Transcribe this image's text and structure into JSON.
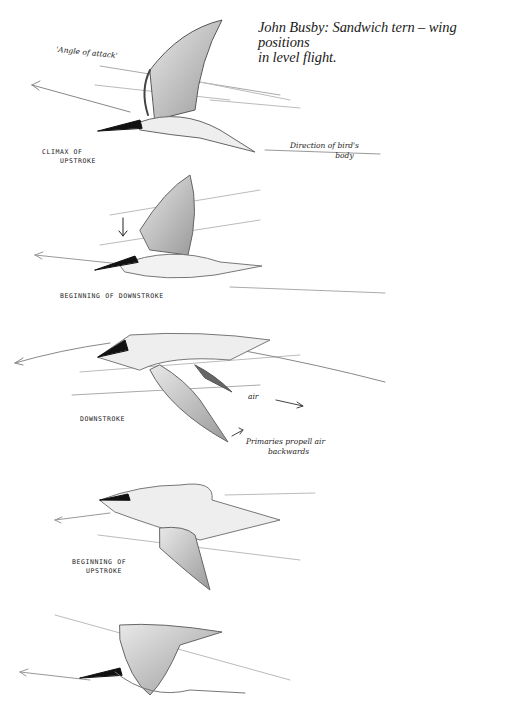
{
  "caption": {
    "line1": "John Busby: Sandwich tern – wing positions",
    "line2": "in level flight."
  },
  "figures": [
    {
      "id": "climax-of-upstroke",
      "label_line1": "Climax of",
      "label_line2": "upstroke",
      "annotations": {
        "angle": "'Angle of attack'",
        "direction_line1": "Direction of bird's",
        "direction_line2": "body"
      }
    },
    {
      "id": "beginning-of-downstroke",
      "label_line1": "Beginning of downstroke"
    },
    {
      "id": "downstroke",
      "label_line1": "Downstroke",
      "annotations": {
        "air": "air",
        "primaries_line1": "Primaries propell air",
        "primaries_line2": "backwards"
      }
    },
    {
      "id": "beginning-of-upstroke",
      "label_line1": "Beginning of",
      "label_line2": "upstroke"
    },
    {
      "id": "final-position"
    }
  ],
  "colors": {
    "ink": "#1a1a1a",
    "wash": "#9a9a9a",
    "paper": "#ffffff"
  }
}
